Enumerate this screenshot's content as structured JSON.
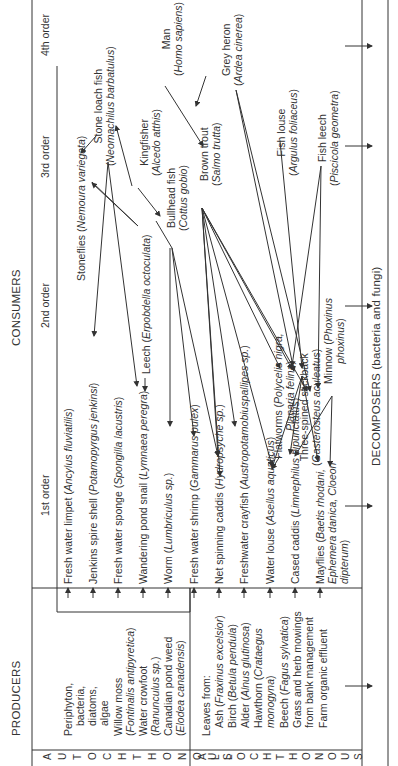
{
  "headers": {
    "producers": "PRODUCERS",
    "consumers": "CONSUMERS",
    "decomposers": "DECOMPOSERS (bacteria and fungi)",
    "orders": [
      "1st order",
      "2nd order",
      "3rd order",
      "4th order"
    ]
  },
  "side_labels": {
    "autochthonous": "AUTOCHTHONOUS",
    "allochthonous": "ALLOCHTHONOUS"
  },
  "producers": {
    "autochthonous": [
      {
        "name": "Periphyton, bacteria, diatoms, algae",
        "lines": [
          "Periphyton,",
          "bacteria,",
          "diatoms,",
          "algae"
        ]
      },
      {
        "name": "Willow moss",
        "latin": "Fontinalis antipyretica"
      },
      {
        "name": "Water crowfoot",
        "latin": "Ranunculus sp."
      },
      {
        "name": "Canadian pond weed",
        "latin": "Elodea canadensis"
      }
    ],
    "allochthonous_intro": "Leaves from:",
    "allochthonous": [
      {
        "name": "Ash",
        "latin": "Fraxinus excelsior"
      },
      {
        "name": "Birch",
        "latin": "Betula pendula"
      },
      {
        "name": "Alder",
        "latin": "Alnus glutinosa"
      },
      {
        "name": "Hawthorn",
        "latin": "Crataegus monogyna"
      },
      {
        "name": "Beech",
        "latin": "Fagus sylvatica"
      },
      {
        "name": "Grass and herb mowings from bank management"
      },
      {
        "name": "Farm organic effluent"
      }
    ]
  },
  "consumers": {
    "first_order": [
      {
        "name": "Fresh water limpet",
        "latin": "Ancylus fluviatilis"
      },
      {
        "name": "Jenkins spire shell",
        "latin": "Potamopyrgus jenkinsi"
      },
      {
        "name": "Fresh water sponge",
        "latin": "Spongilla lacustris"
      },
      {
        "name": "Wandering pond snail",
        "latin": "Lymnaea peregra"
      },
      {
        "name": "Worm",
        "latin": "Lumbriculus sp."
      },
      {
        "name": "Fresh water shrimp",
        "latin": "Gammarus pulex"
      },
      {
        "name": "Net spinning caddis",
        "latin": "Hydropsyche sp."
      },
      {
        "name": "Freshwater crayfish",
        "latin": "Austropotamobiuspallipes sp."
      },
      {
        "name": "Water louse",
        "latin": "Asellus aquaticus"
      },
      {
        "name": "Cased caddis",
        "latin": "Limnephilus bipunctatus"
      },
      {
        "name": "Mayflies",
        "latin": "Baetis rhodani, Ephemera danica, Cloeon dipterum"
      }
    ],
    "second_order": [
      {
        "name": "Stoneflies",
        "latin": "Nemoura variegata"
      },
      {
        "name": "Leech",
        "latin": "Erpobdella octoculata"
      },
      {
        "name": "Flatworms",
        "latin": "Polycelis nigra, Planaria felina"
      },
      {
        "name": "Three-spined stickback",
        "latin": "Gasterosteus aculeatus"
      },
      {
        "name": "Minnow",
        "latin": "Phoxinus phoxinus"
      }
    ],
    "third_order": [
      {
        "name": "Stone loach fish",
        "latin": "Neomachilus barbatulus"
      },
      {
        "name": "Bullhead fish",
        "latin": "Cottus gobio"
      },
      {
        "name": "Kingfisher",
        "latin": "Alcedo atthis"
      },
      {
        "name": "Brown trout",
        "latin": "Salmo trutta"
      },
      {
        "name": "Fish louse",
        "latin": "Argulus foliaceus"
      },
      {
        "name": "Fish leech",
        "latin": "Piscicola geometra"
      }
    ],
    "fourth_order": [
      {
        "name": "Man",
        "latin": "Homo sapiens"
      },
      {
        "name": "Grey heron",
        "latin": "Ardea cinerea"
      }
    ]
  },
  "colors": {
    "line": "#333333",
    "text": "#333333",
    "background": "#ffffff"
  }
}
